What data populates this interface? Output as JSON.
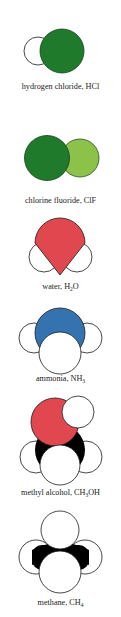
{
  "colors": {
    "chlorine_green": "#1f7a2c",
    "fluorine_green": "#8dc24a",
    "oxygen_red": "#e0474f",
    "nitrogen_blue": "#3573b0",
    "carbon_black": "#000000",
    "hydrogen_white": "#ffffff",
    "outline": "#1a1a1a"
  },
  "molecules": [
    {
      "name": "hydrogen chloride",
      "formula_prefix": "HCl",
      "formula_sub": "",
      "formula_suffix": "",
      "label_prefix": "hydrogen chloride, "
    },
    {
      "name": "chlorine fluoride",
      "formula_prefix": "ClF",
      "formula_sub": "",
      "formula_suffix": "",
      "label_prefix": "chlorine fluoride, "
    },
    {
      "name": "water",
      "formula_prefix": "H",
      "formula_sub": "2",
      "formula_suffix": "O",
      "label_prefix": "water, "
    },
    {
      "name": "ammonia",
      "formula_prefix": "NH",
      "formula_sub": "3",
      "formula_suffix": "",
      "label_prefix": "ammonia, "
    },
    {
      "name": "methyl alcohol",
      "formula_prefix": "CH",
      "formula_sub": "3",
      "formula_suffix": "OH",
      "label_prefix": "methyl alcohol, "
    },
    {
      "name": "methane",
      "formula_prefix": "CH",
      "formula_sub": "4",
      "formula_suffix": "",
      "label_prefix": "methane, "
    }
  ]
}
